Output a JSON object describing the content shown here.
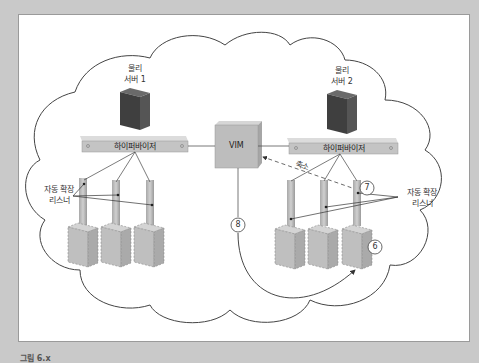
{
  "diagram": {
    "server1": {
      "label_line1": "물리",
      "label_line2": "서버 1"
    },
    "server2": {
      "label_line1": "물리",
      "label_line2": "서버 2"
    },
    "hypervisor1": {
      "label": "하이퍼바이저"
    },
    "hypervisor2": {
      "label": "하이퍼바이저"
    },
    "vim": {
      "label": "VIM"
    },
    "listener_left": {
      "line1": "자동 확장",
      "line2": "리스너"
    },
    "listener_right": {
      "line1": "자동 확장",
      "line2": "리스너"
    },
    "scale_in_label": "축소",
    "steps": {
      "six": "6",
      "seven": "7",
      "eight": "8"
    },
    "colors": {
      "server": "#4a4a4a",
      "hypervisor": "#c4c4c4",
      "vim_box": "#bdbdbd",
      "vm_ghost": "#bfbfbf",
      "cloud_stroke": "#444444",
      "background": "#c9c9c9"
    }
  },
  "caption": "그림 6.x"
}
